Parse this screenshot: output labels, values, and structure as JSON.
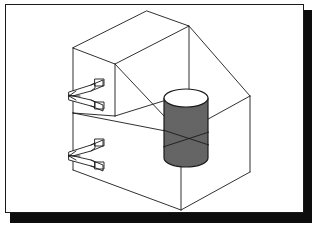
{
  "document": {
    "title": "Isometric wireframe technical drawing",
    "kind": "cad-line-drawing",
    "background_color": "#ffffff",
    "line_color": "#1a1a1a",
    "shadow_color": "#0d0d0d"
  },
  "frame": {
    "border_color": "#1a1a1a",
    "border_width": 1,
    "x": 5,
    "y": 4,
    "width": 299,
    "height": 209,
    "shadow_offset_x": 5,
    "shadow_offset_y": 6
  },
  "drawing": {
    "projection": "isometric",
    "stroke_color": "#1a1a1a",
    "stroke_width": 0.9,
    "objects": [
      {
        "name": "upper-box",
        "type": "wireframe-box",
        "description": "upper rectangular volume, open wireframe",
        "vertices": {
          "top_rear": [
            147,
            11
          ],
          "top_left": [
            73,
            48
          ],
          "top_right": [
            189,
            26
          ],
          "top_front": [
            115,
            64
          ],
          "bottom_left": [
            73,
            113
          ],
          "bottom_front": [
            115,
            116
          ],
          "bottom_right": [
            189,
            93
          ]
        }
      },
      {
        "name": "lower-box",
        "type": "wireframe-box",
        "description": "lower rectangular volume extending to the right",
        "vertices": {
          "top_rear": [
            189,
            26
          ],
          "top_left": [
            115,
            64
          ],
          "top_right": [
            250,
            96
          ],
          "top_front": [
            181,
            134
          ],
          "bottom_left": [
            73,
            170
          ],
          "bottom_front": [
            181,
            210
          ],
          "bottom_right": [
            250,
            172
          ]
        }
      },
      {
        "name": "cylinder",
        "type": "hatched-cylinder",
        "description": "vertical cylinder with vertical hatch lines standing on lower box floor",
        "center_x": 186,
        "top_y": 98,
        "bottom_y": 158,
        "radius_x": 22,
        "radius_y": 9,
        "hatch_count": 21,
        "hatch_color": "#111111"
      },
      {
        "name": "arrow-annotation-upper",
        "type": "double-arrow-pair",
        "description": "pair of left-pointing flag arrows attached to upper box left edge",
        "anchor": [
          73,
          95
        ],
        "arrow_count": 2
      },
      {
        "name": "arrow-annotation-lower",
        "type": "double-arrow-pair",
        "description": "pair of left-pointing flag arrows attached to lower box left edge",
        "anchor": [
          73,
          155
        ],
        "arrow_count": 2
      }
    ]
  }
}
